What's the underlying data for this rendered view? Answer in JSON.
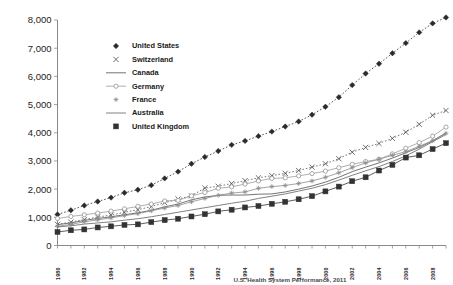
{
  "chart_data": {
    "type": "line",
    "title": "",
    "subtitle": "",
    "xlabel": "",
    "ylabel": "",
    "caption": "Exhibit: Health Care Spending per Capita, 1980–2009  —  U.S. Health System Performance, 2011",
    "grid": false,
    "legend_position": "upper-left-inside",
    "xlim": [
      1980,
      2009
    ],
    "ylim": [
      0,
      8000
    ],
    "yticks": [
      0,
      1000,
      2000,
      3000,
      4000,
      5000,
      6000,
      7000,
      8000
    ],
    "ytick_labels": [
      "0",
      "1,000",
      "2,000",
      "3,000",
      "4,000",
      "5,000",
      "6,000",
      "7,000",
      "8,000"
    ],
    "x": [
      1980,
      1981,
      1982,
      1983,
      1984,
      1985,
      1986,
      1987,
      1988,
      1989,
      1990,
      1991,
      1992,
      1993,
      1994,
      1995,
      1996,
      1997,
      1998,
      1999,
      2000,
      2001,
      2002,
      2003,
      2004,
      2005,
      2006,
      2007,
      2008,
      2009
    ],
    "xtick_labels": [
      "1980",
      "1982",
      "1984",
      "1986",
      "1988",
      "1990",
      "1992",
      "1994",
      "1996",
      "1998",
      "2000",
      "2002",
      "2004",
      "2006",
      "2008"
    ],
    "xtick_values": [
      1980,
      1982,
      1984,
      1986,
      1988,
      1990,
      1992,
      1994,
      1996,
      1998,
      2000,
      2002,
      2004,
      2006,
      2008
    ],
    "series": [
      {
        "name": "United States",
        "marker": "diamond",
        "line_style": "dotted",
        "color": "#2b2b2b",
        "values": [
          1100,
          1250,
          1420,
          1560,
          1700,
          1870,
          1980,
          2140,
          2380,
          2620,
          2900,
          3140,
          3350,
          3570,
          3710,
          3880,
          4040,
          4220,
          4400,
          4640,
          4920,
          5260,
          5690,
          6100,
          6450,
          6820,
          7180,
          7560,
          7880,
          8090
        ]
      },
      {
        "name": "Switzerland",
        "marker": "x",
        "line_style": "dotted",
        "color": "#555555",
        "values": [
          750,
          830,
          920,
          1010,
          1080,
          1180,
          1270,
          1380,
          1520,
          1650,
          1760,
          2040,
          2100,
          2200,
          2300,
          2400,
          2480,
          2560,
          2660,
          2780,
          2900,
          3080,
          3310,
          3480,
          3620,
          3800,
          4020,
          4300,
          4620,
          4790
        ]
      },
      {
        "name": "Canada",
        "marker": "none",
        "line_style": "solid",
        "color": "#6d6d6d",
        "values": [
          740,
          800,
          890,
          960,
          1020,
          1090,
          1160,
          1250,
          1370,
          1470,
          1620,
          1720,
          1780,
          1790,
          1790,
          1820,
          1830,
          1900,
          2000,
          2110,
          2250,
          2420,
          2620,
          2780,
          2930,
          3100,
          3290,
          3480,
          3710,
          4000
        ]
      },
      {
        "name": "Germany",
        "marker": "circle-open",
        "line_style": "solid",
        "color": "#9a9a9a",
        "values": [
          960,
          1030,
          1090,
          1150,
          1220,
          1300,
          1390,
          1470,
          1580,
          1600,
          1760,
          1880,
          2030,
          2080,
          2180,
          2290,
          2380,
          2400,
          2470,
          2550,
          2640,
          2760,
          2880,
          2980,
          3060,
          3250,
          3450,
          3650,
          3880,
          4200
        ]
      },
      {
        "name": "France",
        "marker": "asterisk",
        "line_style": "solid",
        "color": "#8c8c8c",
        "values": [
          680,
          750,
          840,
          910,
          980,
          1060,
          1130,
          1230,
          1330,
          1420,
          1550,
          1670,
          1780,
          1860,
          1900,
          2030,
          2090,
          2130,
          2200,
          2290,
          2420,
          2580,
          2760,
          2930,
          3060,
          3200,
          3330,
          3520,
          3720,
          3980
        ]
      },
      {
        "name": "Australia",
        "marker": "none",
        "line_style": "solid",
        "color": "#7a7a7a",
        "values": [
          660,
          700,
          760,
          800,
          840,
          900,
          950,
          1020,
          1100,
          1180,
          1260,
          1340,
          1420,
          1500,
          1570,
          1670,
          1750,
          1830,
          1930,
          2030,
          2160,
          2320,
          2490,
          2650,
          2800,
          2980,
          3180,
          3420,
          3680,
          3940
        ]
      },
      {
        "name": "United Kingdom",
        "marker": "square",
        "line_style": "solid",
        "color": "#333333",
        "values": [
          480,
          540,
          570,
          640,
          680,
          730,
          750,
          830,
          900,
          950,
          1030,
          1110,
          1210,
          1270,
          1350,
          1400,
          1480,
          1550,
          1640,
          1750,
          1920,
          2090,
          2280,
          2420,
          2660,
          2860,
          3120,
          3200,
          3420,
          3630
        ]
      }
    ]
  },
  "legend": {
    "items": [
      {
        "label": "United States"
      },
      {
        "label": "Switzerland"
      },
      {
        "label": "Canada"
      },
      {
        "label": "Germany"
      },
      {
        "label": "France"
      },
      {
        "label": "Australia"
      },
      {
        "label": "United Kingdom"
      }
    ]
  },
  "caption": {
    "text": "U.S. Health System Performance, 2011"
  }
}
